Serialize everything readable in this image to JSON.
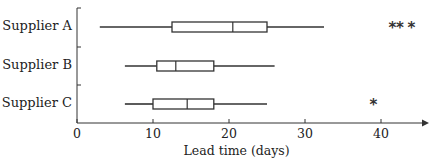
{
  "chart_data": {
    "type": "boxplot",
    "orientation": "horizontal",
    "title": "",
    "xlabel": "Lead time (days)",
    "ylabel": "",
    "xlim": [
      0,
      45
    ],
    "xticks": [
      0,
      10,
      20,
      30,
      40
    ],
    "grid": false,
    "legend": null,
    "categories": [
      "Supplier A",
      "Supplier B",
      "Supplier C"
    ],
    "series": [
      {
        "name": "Supplier A",
        "whisker_low": 3,
        "q1": 12.5,
        "median": 20.5,
        "q3": 25,
        "whisker_high": 32.5,
        "outliers": [
          41.5,
          42.5,
          44
        ]
      },
      {
        "name": "Supplier B",
        "whisker_low": 6.3,
        "q1": 10.5,
        "median": 13,
        "q3": 18,
        "whisker_high": 26,
        "outliers": []
      },
      {
        "name": "Supplier C",
        "whisker_low": 6.3,
        "q1": 10,
        "median": 14.5,
        "q3": 18,
        "whisker_high": 25,
        "outliers": [
          39
        ]
      }
    ],
    "outlier_marker": "*",
    "colors": {
      "line": "#333333",
      "box_fill": "#ffffff",
      "text": "#222222"
    }
  }
}
